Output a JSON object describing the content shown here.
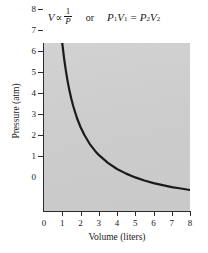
{
  "equation": {
    "left": {
      "variable": "V",
      "proportional_symbol": "∝",
      "numerator": "1",
      "denominator": "P"
    },
    "connector": "or",
    "right": {
      "p1": "P",
      "p1_sub": "1",
      "v1": "V",
      "v1_sub": "1",
      "equals": "=",
      "p2": "P",
      "p2_sub": "2",
      "v2": "V",
      "v2_sub": "2"
    }
  },
  "chart_data": {
    "type": "line",
    "title": "",
    "xlabel": "Volume (liters)",
    "ylabel": "Pressure (atm)",
    "xlim": [
      0,
      8
    ],
    "ylim": [
      0,
      8
    ],
    "xticks": [
      "0",
      "1",
      "2",
      "3",
      "4",
      "5",
      "6",
      "7",
      "8"
    ],
    "yticks": [
      "0",
      "1",
      "2",
      "3",
      "4",
      "5",
      "6",
      "7",
      "8"
    ],
    "grid": false,
    "legend": "none",
    "relationship": "PV = 8 (Boyle's Law, inverse proportion)",
    "series": [
      {
        "name": "Pressure vs Volume",
        "x": [
          1.0,
          1.1,
          1.2,
          1.3,
          1.4,
          1.5,
          1.6,
          1.8,
          2.0,
          2.2,
          2.5,
          2.8,
          3.0,
          3.5,
          4.0,
          4.5,
          5.0,
          5.5,
          6.0,
          6.5,
          7.0,
          7.5,
          8.0
        ],
        "y": [
          8.0,
          7.27,
          6.67,
          6.15,
          5.71,
          5.33,
          5.0,
          4.44,
          4.0,
          3.64,
          3.2,
          2.86,
          2.67,
          2.29,
          2.0,
          1.78,
          1.6,
          1.45,
          1.33,
          1.23,
          1.14,
          1.07,
          1.0
        ]
      }
    ],
    "panel_color": "#cdcdcd",
    "curve_color": "#1a1a1a"
  }
}
